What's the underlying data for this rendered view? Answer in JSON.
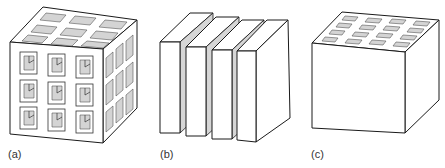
{
  "figure": {
    "panels": [
      {
        "id": "a",
        "label": "(a)",
        "description": "Cube with 3x3 square through-holes on each face (3D network)"
      },
      {
        "id": "b",
        "label": "(b)",
        "description": "Four parallel slabs separated by gaps (layered structure)"
      },
      {
        "id": "c",
        "label": "(c)",
        "description": "Solid cube with 4x4 array of channels on the top face only"
      }
    ],
    "colors": {
      "line": "#1a1a1a",
      "fill": "#ffffff",
      "shade": "#d4d4d4",
      "label": "#333333"
    }
  }
}
